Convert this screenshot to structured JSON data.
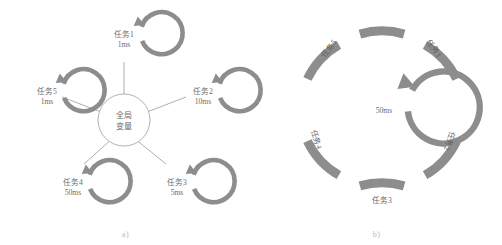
{
  "figure": {
    "panels": [
      {
        "id": "a",
        "caption": "a)",
        "center": {
          "line1": "全局",
          "line2": "变量"
        },
        "nodes": [
          {
            "name": "任务1",
            "period": "1ms",
            "cx": 124,
            "cy": 38,
            "angle_deg": 270
          },
          {
            "name": "任务2",
            "period": "10ms",
            "cx": 202,
            "cy": 95,
            "angle_deg": 324
          },
          {
            "name": "任务3",
            "period": "5ms",
            "cx": 176,
            "cy": 186,
            "angle_deg": 36
          },
          {
            "name": "任务4",
            "period": "50ms",
            "cx": 72,
            "cy": 186,
            "angle_deg": 144
          },
          {
            "name": "任务5",
            "period": "1ms",
            "cx": 46,
            "cy": 95,
            "angle_deg": 216
          }
        ]
      },
      {
        "id": "b",
        "caption": "b)",
        "inner": {
          "label": "50ms"
        },
        "arcs": [
          {
            "name": "任务1",
            "label_angle_deg": -54,
            "text_rotate_deg": 54
          },
          {
            "name": "任务2",
            "label_angle_deg": 18,
            "text_rotate_deg": 108
          },
          {
            "name": "任务3",
            "label_angle_deg": 90,
            "text_rotate_deg": 0
          },
          {
            "name": "任务4",
            "label_angle_deg": 162,
            "text_rotate_deg": 72
          },
          {
            "name": "任务5",
            "label_angle_deg": -126,
            "text_rotate_deg": -54
          }
        ]
      }
    ]
  },
  "colors": {
    "arc_gray": "#8d8d8d",
    "line_gray": "#9a9a9a",
    "text_gray": "#6a6a6a",
    "caption_gray": "#b9b9b9",
    "background": "#ffffff"
  }
}
